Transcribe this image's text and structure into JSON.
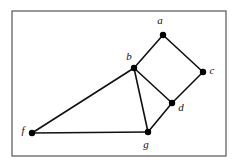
{
  "figure": {
    "background_color": "#ffffff",
    "frame": {
      "name": "figure-border",
      "x": 12,
      "y": 11,
      "width": 214,
      "height": 145,
      "stroke_color": "#555555",
      "stroke_width": 1.2
    },
    "style": {
      "edge_color": "#111111",
      "edge_width": 1.6,
      "node_color": "#000000",
      "node_radius": 3.2,
      "label_color": "#111111",
      "label_font_size": 11
    },
    "nodes": [
      {
        "id": "a",
        "label": "a",
        "x": 163,
        "y": 35,
        "label_x": 160,
        "label_y": 24
      },
      {
        "id": "b",
        "label": "b",
        "x": 134,
        "y": 68,
        "label_x": 129,
        "label_y": 60
      },
      {
        "id": "c",
        "label": "c",
        "x": 203,
        "y": 72,
        "label_x": 212,
        "label_y": 74
      },
      {
        "id": "d",
        "label": "d",
        "x": 172,
        "y": 103,
        "label_x": 181,
        "label_y": 111
      },
      {
        "id": "f",
        "label": "f",
        "x": 32,
        "y": 133,
        "label_x": 23,
        "label_y": 134
      },
      {
        "id": "g",
        "label": "g",
        "x": 148,
        "y": 132,
        "label_x": 146,
        "label_y": 148
      }
    ],
    "edges": [
      {
        "from": "a",
        "to": "b"
      },
      {
        "from": "a",
        "to": "c"
      },
      {
        "from": "b",
        "to": "d"
      },
      {
        "from": "b",
        "to": "g"
      },
      {
        "from": "b",
        "to": "f"
      },
      {
        "from": "c",
        "to": "d"
      },
      {
        "from": "d",
        "to": "g"
      },
      {
        "from": "f",
        "to": "g"
      }
    ]
  }
}
